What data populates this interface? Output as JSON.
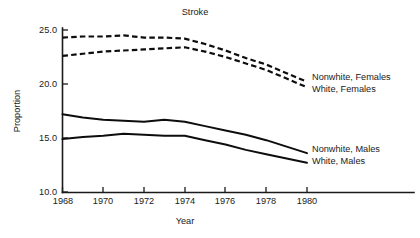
{
  "chart_data": {
    "type": "line",
    "title": "Stroke",
    "xlabel": "Year",
    "ylabel": "Proportion",
    "xlim": [
      1968,
      1980.8
    ],
    "ylim": [
      10.0,
      25.0
    ],
    "grid": false,
    "legend_position": "right-inline-annotations",
    "x": [
      1968,
      1969,
      1970,
      1971,
      1972,
      1973,
      1974,
      1975,
      1976,
      1977,
      1978,
      1979,
      1980
    ],
    "xticks": [
      1968,
      1970,
      1972,
      1974,
      1976,
      1978,
      1980
    ],
    "xtick_labels": [
      "1968",
      "1970",
      "1972",
      "1974",
      "1976",
      "1978",
      "1980"
    ],
    "yticks": [
      10.0,
      15.0,
      20.0,
      25.0
    ],
    "ytick_labels": [
      "10.0",
      "15.0",
      "20.0",
      "25.0"
    ],
    "series": [
      {
        "name": "Nonwhite, Females",
        "style": "dashed",
        "values": [
          24.3,
          24.4,
          24.4,
          24.5,
          24.3,
          24.3,
          24.2,
          23.7,
          23.1,
          22.4,
          21.8,
          21.0,
          20.2
        ]
      },
      {
        "name": "White, Females",
        "style": "dashed",
        "values": [
          22.6,
          22.8,
          23.0,
          23.1,
          23.2,
          23.3,
          23.4,
          23.0,
          22.5,
          21.9,
          21.3,
          20.5,
          19.7
        ]
      },
      {
        "name": "Nonwhite, Males",
        "style": "solid",
        "values": [
          17.2,
          16.9,
          16.7,
          16.6,
          16.5,
          16.7,
          16.5,
          16.1,
          15.7,
          15.3,
          14.8,
          14.2,
          13.6
        ]
      },
      {
        "name": "White, Males",
        "style": "solid",
        "values": [
          14.9,
          15.1,
          15.2,
          15.4,
          15.3,
          15.2,
          15.2,
          14.8,
          14.4,
          13.9,
          13.5,
          13.1,
          12.7
        ]
      }
    ],
    "annotations": [
      {
        "text": "Nonwhite, Females",
        "series": "Nonwhite, Females"
      },
      {
        "text": "White, Females",
        "series": "White, Females"
      },
      {
        "text": "Nonwhite, Males",
        "series": "Nonwhite, Males"
      },
      {
        "text": "White, Males",
        "series": "White, Males"
      }
    ]
  },
  "annotation_labels": {
    "nonwhite_females": "Nonwhite, Females",
    "white_females": "White, Females",
    "nonwhite_males": "Nonwhite, Males",
    "white_males": "White, Males"
  }
}
